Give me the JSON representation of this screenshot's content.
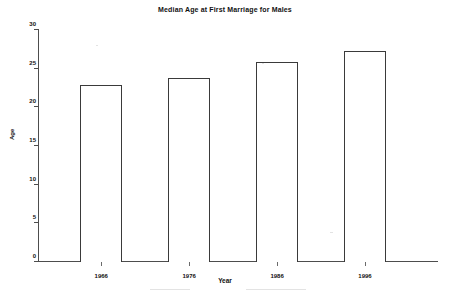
{
  "chart_data": {
    "type": "bar",
    "title": "Median Age at First Marriage for Males",
    "xlabel": "Year",
    "ylabel": "Age",
    "categories": [
      "1966",
      "1976",
      "1986",
      "1996"
    ],
    "values": [
      22.9,
      23.8,
      25.8,
      27.3
    ],
    "ylim": [
      0,
      30
    ],
    "yticks": [
      "0",
      "5",
      "10",
      "15",
      "20",
      "25",
      "30"
    ],
    "ytick_values": [
      0,
      5,
      10,
      15,
      20,
      25,
      30
    ],
    "grid": false,
    "legend": "none",
    "bar_fill_color": "#ffffff",
    "bar_edge_color": "#3a3a3a",
    "axis_color": "#4d4d4d",
    "background_color": "#ffffff"
  }
}
